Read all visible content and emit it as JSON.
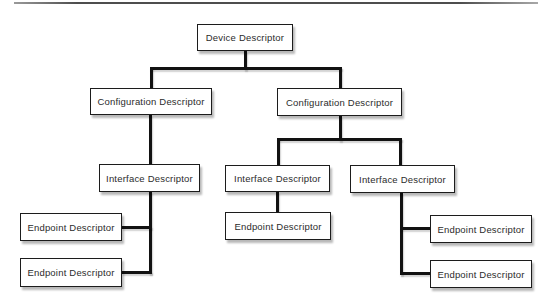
{
  "nodes": {
    "device": {
      "label": "Device Descriptor"
    },
    "config_left": {
      "label": "Configuration Descriptor"
    },
    "config_right": {
      "label": "Configuration Descriptor"
    },
    "interface_left": {
      "label": "Interface Descriptor"
    },
    "interface_mid": {
      "label": "Interface Descriptor"
    },
    "interface_right": {
      "label": "Interface Descriptor"
    },
    "endpoint_left_1": {
      "label": "Endpoint Descriptor"
    },
    "endpoint_left_2": {
      "label": "Endpoint Descriptor"
    },
    "endpoint_mid": {
      "label": "Endpoint Descriptor"
    },
    "endpoint_right_1": {
      "label": "Endpoint Descriptor"
    },
    "endpoint_right_2": {
      "label": "Endpoint Descriptor"
    }
  },
  "colors": {
    "background": "#ffffff",
    "box_fill": "#ffffff",
    "box_border": "#1c1c1c",
    "connector": "#121212",
    "text": "#2b2b2b",
    "top_rule": "#4d4d4d"
  }
}
